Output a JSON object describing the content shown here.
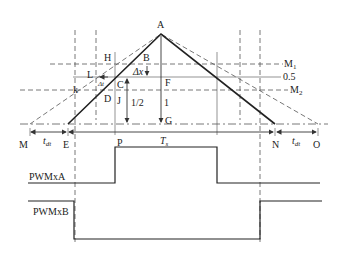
{
  "diagram": {
    "type": "PWM dead-time timing diagram",
    "points": {
      "A": "A",
      "B": "B",
      "C": "C",
      "D": "D",
      "E": "E",
      "F": "F",
      "G": "G",
      "H": "H",
      "J": "J",
      "L": "L",
      "k": "k",
      "M": "M",
      "N": "N",
      "O": "O",
      "P": "P"
    },
    "levels": {
      "M1": "M",
      "M1_sub": "1",
      "half": "0.5",
      "M2": "M",
      "M2_sub": "2"
    },
    "annotations": {
      "delta_x": "Δx",
      "half_ratio": "1/2",
      "one": "1",
      "t_dt_left": "t",
      "t_dt_left_sub": "dt",
      "t_dt_right": "t",
      "t_dt_right_sub": "dt",
      "period": "T",
      "period_sub": "s"
    },
    "signals": {
      "pwm_a": "PWMxA",
      "pwm_b": "PWMxB"
    }
  }
}
